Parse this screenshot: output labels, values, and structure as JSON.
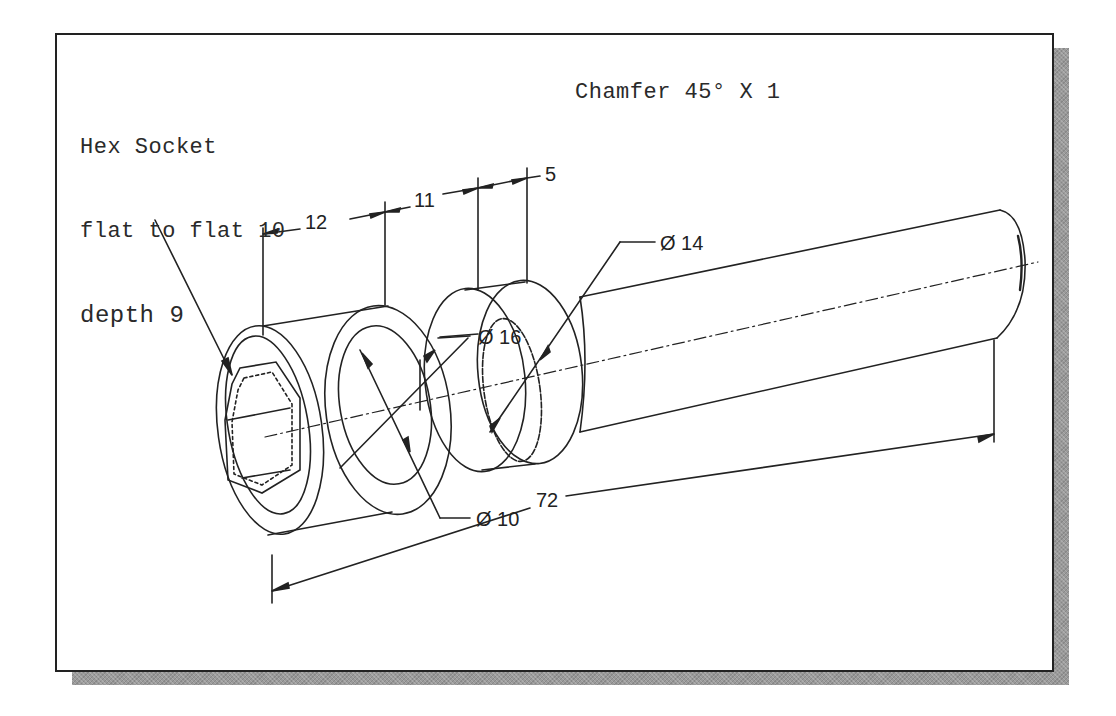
{
  "drawing": {
    "type": "isometric technical drawing",
    "subject": "cylindrical pin / socket head part with hex socket",
    "colors": {
      "line": "#222222",
      "frame_border": "#222222",
      "shadow": "#9a9a9a",
      "background": "#ffffff"
    }
  },
  "notes": {
    "hex_socket": {
      "line1": "Hex Socket",
      "line2": "flat to flat 10",
      "line3": "depth 9"
    },
    "chamfer": {
      "text": "Chamfer 45° X 1"
    }
  },
  "dimensions": {
    "length_12": "12",
    "length_11": "11",
    "length_5": "5",
    "length_72": "72",
    "diameter_14": "Ø 14",
    "diameter_16": "Ø 16",
    "diameter_10": "Ø 10"
  }
}
